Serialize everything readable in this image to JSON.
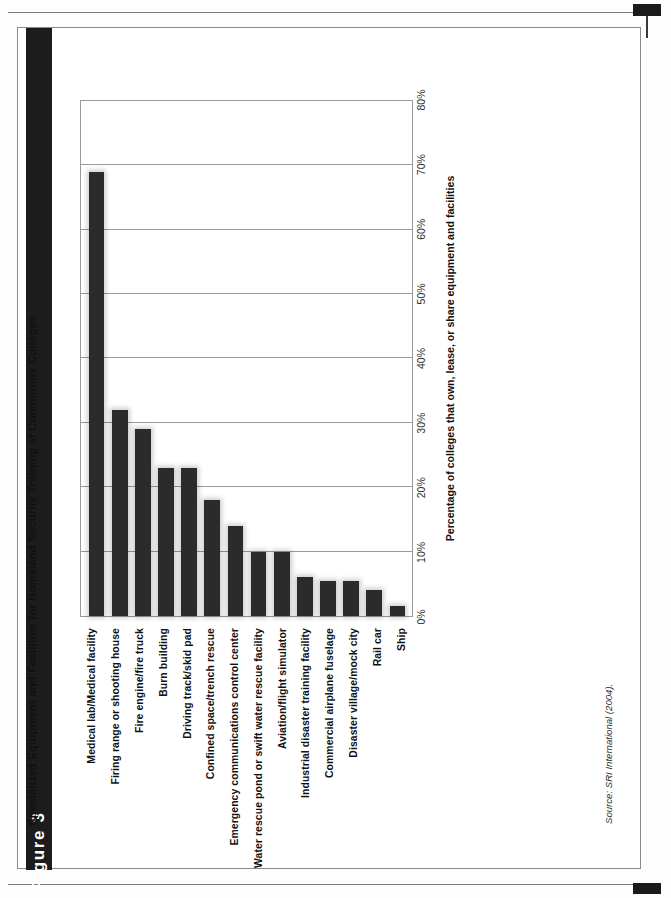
{
  "figure": {
    "tab_label": "Figure 3",
    "title": "Specialized Equipment and Facilities for Homeland Security Training at Community Colleges",
    "source_note": "Source: SRI International (2004).",
    "accent_color": "#1c1c1c",
    "bar_color": "#2b2b2b",
    "grid_color": "#9a9a9a"
  },
  "chart_data": {
    "type": "bar",
    "title": "Specialized Equipment and Facilities for Homeland Security Training at Community Colleges",
    "xlabel": "",
    "ylabel": "Percentage of colleges that own, lease, or share equipment and facilities",
    "ylim": [
      0,
      80
    ],
    "grid": true,
    "legend": null,
    "orientation": "vertical-bars-rotated-page",
    "yticks": [
      0,
      10,
      20,
      30,
      40,
      50,
      60,
      70,
      80
    ],
    "ytick_labels": [
      "0%",
      "10%",
      "20%",
      "30%",
      "40%",
      "50%",
      "60%",
      "70%",
      "80%"
    ],
    "categories": [
      "Medical lab/Medical facility",
      "Firing range or shooting house",
      "Fire engine/fire truck",
      "Burn building",
      "Driving track/skid pad",
      "Confined space/trench rescue",
      "Emergency communications control center",
      "Water rescue pond or swift water rescue facility",
      "Aviation/flight simulator",
      "Industrial disaster training facility",
      "Commercial airplane fuselage",
      "Disaster village/mock city",
      "Rail car",
      "Ship"
    ],
    "values": [
      69,
      32,
      29,
      23,
      23,
      18,
      14,
      10,
      10,
      6,
      5.5,
      5.5,
      4,
      1.5
    ]
  }
}
